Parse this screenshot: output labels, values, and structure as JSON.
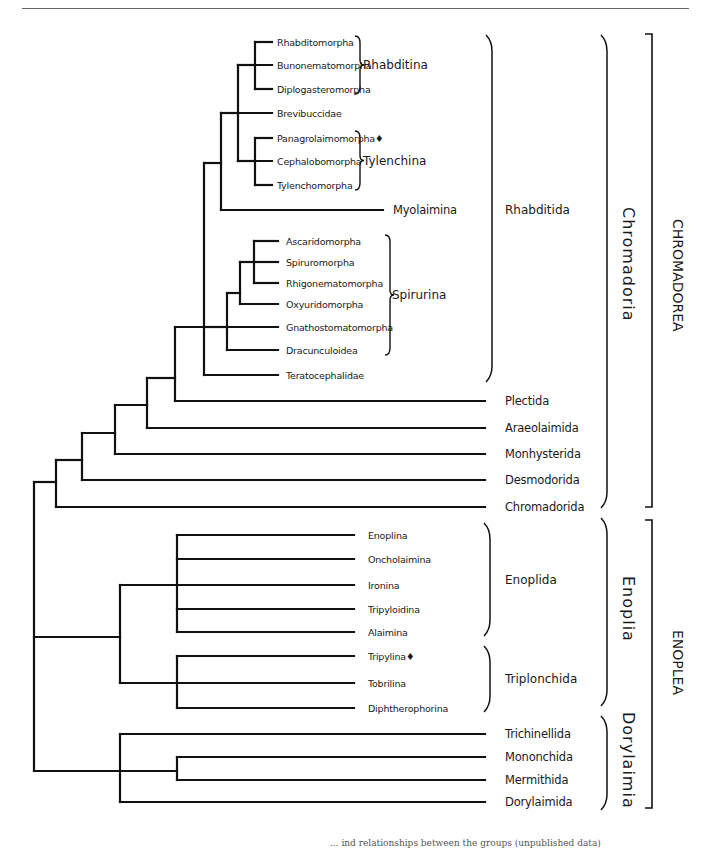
{
  "figure": {
    "type": "phylogenetic-tree",
    "line_color": "#111111",
    "footer_fragment": "...  ind relationships between the groups (unpublished data)"
  },
  "leaves": [
    {
      "label": "Rhabditomorpha",
      "y": 42,
      "x_end": 272,
      "lx": 277,
      "small": true
    },
    {
      "label": "Bunonematomorpha",
      "y": 65,
      "x_end": 272,
      "lx": 277,
      "small": true
    },
    {
      "label": "Diplogasteromorpha",
      "y": 89,
      "x_end": 272,
      "lx": 277,
      "small": true
    },
    {
      "label": "Brevibuccidae",
      "y": 113,
      "x_end": 272,
      "lx": 277,
      "small": true
    },
    {
      "label": "Panagrolaimomorpha♦",
      "y": 138,
      "x_end": 272,
      "lx": 277,
      "small": true
    },
    {
      "label": "Cephalobomorpha",
      "y": 161,
      "x_end": 272,
      "lx": 277,
      "small": true
    },
    {
      "label": "Tylenchomorpha",
      "y": 185,
      "x_end": 272,
      "lx": 277,
      "small": true
    },
    {
      "label": "Myolaimina",
      "y": 210,
      "x_end": 383,
      "lx": 393,
      "small": false
    },
    {
      "label": "Ascaridomorpha",
      "y": 241,
      "x_end": 278,
      "lx": 286,
      "small": true
    },
    {
      "label": "Spiruromorpha",
      "y": 262,
      "x_end": 278,
      "lx": 286,
      "small": true
    },
    {
      "label": "Rhigonematomorpha",
      "y": 283,
      "x_end": 278,
      "lx": 286,
      "small": true
    },
    {
      "label": "Oxyuridomorpha",
      "y": 304,
      "x_end": 278,
      "lx": 286,
      "small": true
    },
    {
      "label": "Gnathostomatomorpha",
      "y": 327,
      "x_end": 278,
      "lx": 286,
      "small": true
    },
    {
      "label": "Dracunculoidea",
      "y": 350,
      "x_end": 278,
      "lx": 286,
      "small": true
    },
    {
      "label": "Teratocephalidae",
      "y": 375,
      "x_end": 278,
      "lx": 286,
      "small": true
    },
    {
      "label": "Plectida",
      "y": 401,
      "x_end": 485,
      "lx": 505,
      "small": false
    },
    {
      "label": "Araeolaimida",
      "y": 428,
      "x_end": 485,
      "lx": 505,
      "small": false
    },
    {
      "label": "Monhysterida",
      "y": 454,
      "x_end": 485,
      "lx": 505,
      "small": false
    },
    {
      "label": "Desmodorida",
      "y": 480,
      "x_end": 485,
      "lx": 505,
      "small": false
    },
    {
      "label": "Chromadorida",
      "y": 507,
      "x_end": 485,
      "lx": 505,
      "small": false
    },
    {
      "label": "Enoplina",
      "y": 535,
      "x_end": 354,
      "lx": 368,
      "small": true
    },
    {
      "label": "Oncholaimina",
      "y": 559,
      "x_end": 354,
      "lx": 368,
      "small": true
    },
    {
      "label": "Ironina",
      "y": 585,
      "x_end": 354,
      "lx": 368,
      "small": true
    },
    {
      "label": "Tripyloidina",
      "y": 609,
      "x_end": 354,
      "lx": 368,
      "small": true
    },
    {
      "label": "Alaimina",
      "y": 632,
      "x_end": 354,
      "lx": 368,
      "small": true
    },
    {
      "label": "Tripylina♦",
      "y": 656,
      "x_end": 354,
      "lx": 368,
      "small": true
    },
    {
      "label": "Tobrilina",
      "y": 683,
      "x_end": 354,
      "lx": 368,
      "small": true
    },
    {
      "label": "Diphtherophorina",
      "y": 708,
      "x_end": 354,
      "lx": 368,
      "small": true
    },
    {
      "label": "Trichinellida",
      "y": 734,
      "x_end": 485,
      "lx": 505,
      "small": false
    },
    {
      "label": "Mononchida",
      "y": 757,
      "x_end": 485,
      "lx": 505,
      "small": false
    },
    {
      "label": "Mermithida",
      "y": 780,
      "x_end": 485,
      "lx": 505,
      "small": false
    },
    {
      "label": "Dorylaimida",
      "y": 802,
      "x_end": 485,
      "lx": 505,
      "small": false
    }
  ],
  "nodes": [
    {
      "name": "rhabditina",
      "x": 255,
      "y1": 42,
      "y2": 89,
      "parent_x": 238,
      "py": 65
    },
    {
      "name": "tylenchina",
      "x": 255,
      "y1": 138,
      "y2": 185,
      "parent_x": 238,
      "py": 161
    },
    {
      "name": "rhabditina-brevi-tylenchina",
      "x": 238,
      "y1": 65,
      "y2": 161,
      "extra_leaf_y": 113,
      "parent_x": 221,
      "py": 113
    },
    {
      "name": "rhabditina-myolaimina",
      "x": 221,
      "y1": 113,
      "y2": 210,
      "parent_x": 204,
      "py": 163
    },
    {
      "name": "spirurina-asc-spi-rhi",
      "x": 254,
      "y1": 241,
      "y2": 283,
      "extra_leaf_y": 262,
      "parent_x": 240,
      "py": 262
    },
    {
      "name": "spirurina-plus-oxy",
      "x": 240,
      "y1": 262,
      "y2": 304,
      "parent_x": 227,
      "py": 293
    },
    {
      "name": "spirurina-plus-drac",
      "x": 227,
      "y1": 293,
      "y2": 350,
      "parent_x": 204,
      "py": 327
    },
    {
      "name": "rhabditida",
      "x": 204,
      "y1": 163,
      "y2": 375,
      "extra_leaf_y": 327,
      "parent_x": 175,
      "py": 327
    },
    {
      "name": "rhabditida-plectida",
      "x": 175,
      "y1": 327,
      "y2": 401,
      "parent_x": 147,
      "py": 378
    },
    {
      "name": "plus-araeolaimida",
      "x": 147,
      "y1": 378,
      "y2": 428,
      "parent_x": 115,
      "py": 405
    },
    {
      "name": "plus-monhysterida",
      "x": 115,
      "y1": 405,
      "y2": 454,
      "parent_x": 82,
      "py": 433
    },
    {
      "name": "plus-desmodorida",
      "x": 82,
      "y1": 433,
      "y2": 480,
      "parent_x": 56,
      "py": 460
    },
    {
      "name": "chromadoria",
      "x": 56,
      "y1": 460,
      "y2": 507,
      "parent_x": 34,
      "py": 482
    },
    {
      "name": "enoplida",
      "x": 177,
      "y1": 535,
      "y2": 632,
      "extra_leaf_ys": [
        559,
        585,
        609
      ],
      "parent_x": 120,
      "py": 585
    },
    {
      "name": "triplonchida",
      "x": 177,
      "y1": 656,
      "y2": 708,
      "extra_leaf_y": 683,
      "parent_x": 120,
      "py": 683
    },
    {
      "name": "enoplia",
      "x": 120,
      "y1": 585,
      "y2": 683,
      "parent_x": 34,
      "py": 637
    },
    {
      "name": "mononchida-mermithida",
      "x": 177,
      "y1": 757,
      "y2": 780,
      "parent_x": 120,
      "py": 771
    },
    {
      "name": "dorylaimia",
      "x": 120,
      "y1": 734,
      "y2": 802,
      "extra_leaf_y": 771,
      "parent_x": 34,
      "py": 771
    },
    {
      "name": "root",
      "x": 34,
      "y1": 482,
      "y2": 771
    }
  ],
  "group_brackets": [
    {
      "label": "Rhabditina",
      "type": "brace",
      "x": 355,
      "y1": 36,
      "y2": 94,
      "lx": 363
    },
    {
      "label": "Tylenchina",
      "type": "brace",
      "x": 355,
      "y1": 131,
      "y2": 190,
      "lx": 363
    },
    {
      "label": "Spirurina",
      "type": "brace",
      "x": 385,
      "y1": 235,
      "y2": 355,
      "lx": 392
    },
    {
      "label": "Rhabditida",
      "type": "brace",
      "x": 486,
      "y1": 35,
      "y2": 382,
      "lx": 505
    },
    {
      "label": "Enoplida",
      "type": "brace",
      "x": 484,
      "y1": 523,
      "y2": 636,
      "lx": 505
    },
    {
      "label": "Triplonchida",
      "type": "brace",
      "x": 484,
      "y1": 646,
      "y2": 712,
      "lx": 505
    }
  ],
  "vertical_brackets": [
    {
      "label": "Chromadoria",
      "type": "brace",
      "x": 601,
      "y1": 35,
      "y2": 508,
      "lx": 628,
      "ly": 207,
      "size": "mid"
    },
    {
      "label": "Enoplia",
      "type": "brace",
      "x": 601,
      "y1": 518,
      "y2": 706,
      "lx": 628,
      "ly": 576,
      "size": "mid"
    },
    {
      "label": "Dorylaimia",
      "type": "brace",
      "x": 601,
      "y1": 716,
      "y2": 810,
      "lx": 628,
      "ly": 712,
      "size": "mid"
    },
    {
      "label": "CHROMADOREA",
      "type": "square",
      "x": 652,
      "y1": 34,
      "y2": 507,
      "lx": 678,
      "ly": 219,
      "size": "top"
    },
    {
      "label": "ENOPLEA",
      "type": "square",
      "x": 652,
      "y1": 520,
      "y2": 808,
      "lx": 678,
      "ly": 630,
      "size": "top"
    }
  ]
}
